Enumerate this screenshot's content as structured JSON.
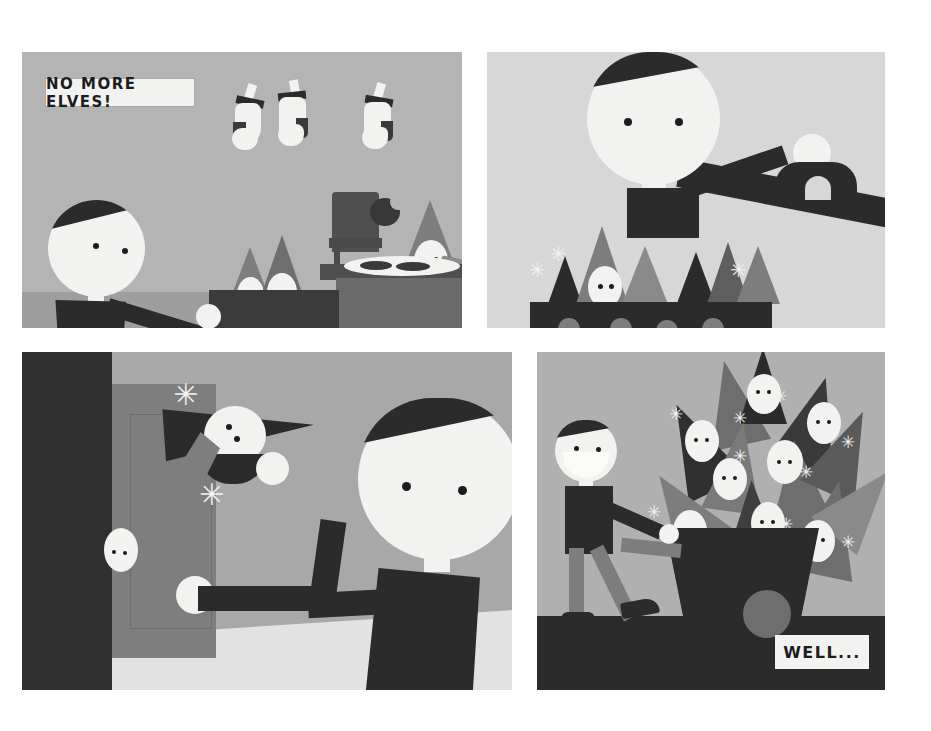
{
  "comic": {
    "title": "No More Elves",
    "page_background": "#ffffff",
    "panel_count": 4,
    "captions": [
      {
        "id": "caption-no-more-elves",
        "text": "NO MORE ELVES!",
        "panel": 1
      },
      {
        "id": "caption-well",
        "text": "WELL...",
        "panel": 4
      }
    ],
    "palette": {
      "paper_white": "#f2f2f0",
      "ink_black": "#2b2b2b",
      "deep_black": "#262626",
      "mid_gray": "#8f8f8f",
      "dark_gray": "#6e6e6e",
      "panel1_bg": "#b4b4b4",
      "panel2_bg": "#d7d7d7",
      "panel3_bg": "#a8a8a8",
      "panel3_floor": "#e2e2e2",
      "panel4_bg": "#b0b0b0",
      "panel4_floor": "#2b2b2b",
      "elf_hat": "#7d7d7d",
      "table_top": "#5d5d5d",
      "table_front": "#6f6f6f"
    },
    "panels": [
      {
        "number": 1,
        "name": "panel-1-dinner-table",
        "x": 22,
        "y": 52,
        "width": 440,
        "height": 276,
        "background": "#b4b4b4",
        "description": "Santa shouts NO MORE ELVES at elves eating cookies at a table; three stockings hang above.",
        "caption": "NO MORE ELVES!",
        "elements": [
          "santa",
          "stocking-1",
          "stocking-2",
          "stocking-3",
          "elf-a",
          "elf-b",
          "elf-c",
          "table",
          "chair",
          "cookie-plate",
          "bitten-cookie"
        ]
      },
      {
        "number": 2,
        "name": "panel-2-caged-elves",
        "x": 487,
        "y": 52,
        "width": 398,
        "height": 276,
        "background": "#d7d7d7",
        "description": "Santa and a helper load elves into a barred crate.",
        "caption": "",
        "elements": [
          "santa-head",
          "helper-head",
          "beam-arm",
          "crate",
          "crate-bars",
          "elf-hats"
        ]
      },
      {
        "number": 3,
        "name": "panel-3-throwing-out",
        "x": 22,
        "y": 352,
        "width": 490,
        "height": 338,
        "background": "#a8a8a8",
        "description": "Santa throws a struggling elf out through an open doorway.",
        "caption": "",
        "elements": [
          "doorway",
          "door-panel",
          "santa-head",
          "santa-arm",
          "flung-elf",
          "outside-elf"
        ]
      },
      {
        "number": 4,
        "name": "panel-4-wheelbarrow",
        "x": 537,
        "y": 352,
        "width": 348,
        "height": 338,
        "background": "#b0b0b0",
        "description": "A grinning Santa pushes a wheelbarrow heaped with elves.",
        "caption": "WELL...",
        "elements": [
          "santa-smiling",
          "wheelbarrow",
          "wheel",
          "elf-pile",
          "floor"
        ]
      }
    ]
  }
}
